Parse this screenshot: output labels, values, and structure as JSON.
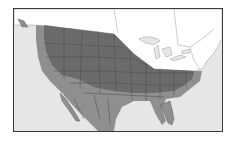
{
  "map": {
    "title": "Species range map",
    "region": "North America (USA, southern Canada, Mexico)",
    "legend": [
      {
        "label": "Primary range",
        "color": "#6b6b6b"
      },
      {
        "label": "Peripheral range",
        "color": "#8f8f8f"
      },
      {
        "label": "Outside range (land)",
        "color": "#ffffff"
      },
      {
        "label": "Water",
        "color": "#e6e6e6"
      }
    ],
    "colors": {
      "frame": "#3a3a3a",
      "water": "#e6e6e6",
      "land_outside": "#ffffff",
      "range_core": "#6b6b6b",
      "range_edge": "#8f8f8f",
      "borders": "#4a4a4a"
    }
  }
}
